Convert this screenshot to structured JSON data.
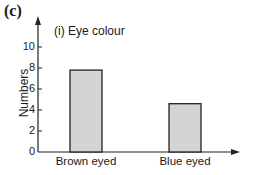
{
  "panel_label": "(c)",
  "chart_data": {
    "type": "bar",
    "title": "(i) Eye colour",
    "categories": [
      "Brown eyed",
      "Blue eyed"
    ],
    "values": [
      7.8,
      4.6
    ],
    "xlabel": "",
    "ylabel": "Numbers",
    "ylim": [
      0,
      10
    ],
    "yticks": [
      0,
      2,
      4,
      6,
      8,
      10
    ],
    "grid": false,
    "legend": null,
    "bar_color": "#d4d4d4",
    "edge_color": "#222222"
  },
  "ytick_labels": [
    "0",
    "2",
    "4",
    "6",
    "8",
    "10"
  ]
}
